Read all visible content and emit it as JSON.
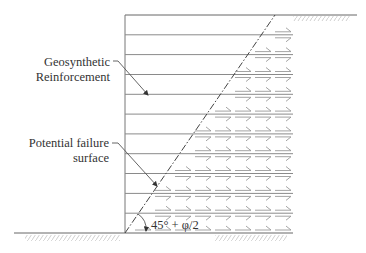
{
  "diagram": {
    "type": "reinforced-soil-wall-cross-section",
    "labels": {
      "reinforcement_line1": "Geosynthetic",
      "reinforcement_line2": "Reinforcement",
      "failure_line1": "Potential failure",
      "failure_line2": "surface",
      "angle": "45° + φ/2"
    },
    "geometry": {
      "wall_face_x": 125,
      "top_y": 15,
      "base_y": 233,
      "reinforcement_end_x": 293,
      "reinforcement_count": 11,
      "failure_top_x": 275
    },
    "colors": {
      "lines": "#777777",
      "arrows": "#9a9a9a",
      "text": "#333333",
      "hatch": "#bbbbbb"
    }
  }
}
